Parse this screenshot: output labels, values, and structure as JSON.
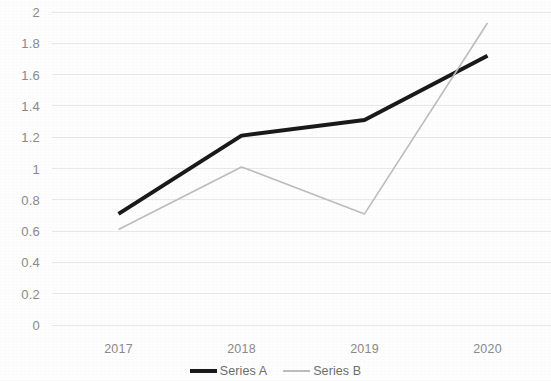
{
  "chart_data": {
    "type": "line",
    "title": "",
    "subtitle": "",
    "xlabel": "",
    "ylabel": "",
    "categories": [
      "2017",
      "2018",
      "2019",
      "2020"
    ],
    "series": [
      {
        "name": "Series A",
        "values": [
          0.71,
          1.21,
          1.31,
          1.72
        ],
        "color": "#1a1a1a",
        "line_width": 4
      },
      {
        "name": "Series B",
        "values": [
          0.61,
          1.01,
          0.71,
          1.93
        ],
        "color": "#bdbdbd",
        "line_width": 1.6
      }
    ],
    "ylim": [
      0,
      2
    ],
    "ytick_step": 0.2,
    "ytick_labels": [
      "2",
      "1.8",
      "1.6",
      "1.4",
      "1.2",
      "1",
      "0.8",
      "0.6",
      "0.4",
      "0.2",
      "0"
    ],
    "xtick_labels": [
      "2017",
      "2018",
      "2019",
      "2020"
    ],
    "grid": true,
    "grid_axis": "y",
    "grid_color": "#e8e8e8",
    "legend_position": "bottom",
    "background_color": "#ffffff",
    "axis_text_color": "#8a8a8a"
  },
  "legend": {
    "entries": [
      {
        "label": "Series A"
      },
      {
        "label": "Series B"
      }
    ]
  }
}
